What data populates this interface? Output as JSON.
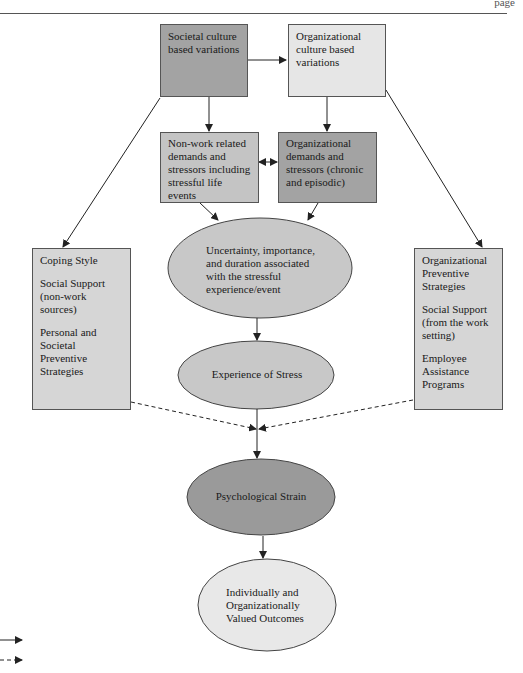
{
  "header": {
    "text": "page"
  },
  "nodes": {
    "societal_culture": {
      "label": "Societal culture based variations",
      "fill": "#a3a3a3"
    },
    "organizational_culture": {
      "label": "Organizational culture based variations",
      "fill": "#e6e6e6"
    },
    "nonwork_demands": {
      "label": "Non-work related demands and stressors including stressful life events",
      "fill": "#c4c4c4"
    },
    "org_demands": {
      "label": "Organizational demands and stressors (chronic and episodic)",
      "fill": "#a3a3a3"
    },
    "coping": {
      "fill": "#d6d6d6",
      "items": [
        "Coping Style",
        "Social Support (non-work sources)",
        "Personal and Societal Preventive Strategies"
      ]
    },
    "org_preventive": {
      "fill": "#d6d6d6",
      "items": [
        "Organizational Preventive Strategies",
        "Social Support (from the work setting)",
        "Employee Assistance Programs"
      ]
    },
    "uncertainty": {
      "label": "Uncertainty, importance, and duration associated with the stressful experience/event",
      "fill": "#c8c8c8"
    },
    "experience": {
      "label": "Experience of Stress",
      "fill": "#c8c8c8"
    },
    "strain": {
      "label": "Psychological Strain",
      "fill": "#9a9a9a"
    },
    "outcomes": {
      "label": "Individually and Organizationally Valued Outcomes",
      "fill": "#e8e8e8"
    }
  },
  "edges": [
    {
      "from": "Societal culture based variations",
      "to": "Organizational culture based variations",
      "style": "solid"
    },
    {
      "from": "Societal culture based variations",
      "to": "Non-work related demands and stressors",
      "style": "solid"
    },
    {
      "from": "Societal culture based variations",
      "to": "Coping Style",
      "style": "solid"
    },
    {
      "from": "Organizational culture based variations",
      "to": "Organizational demands and stressors",
      "style": "solid"
    },
    {
      "from": "Organizational culture based variations",
      "to": "Organizational Preventive Strategies",
      "style": "solid"
    },
    {
      "from": "Non-work related demands and stressors",
      "to": "Organizational demands and stressors",
      "style": "bidirectional"
    },
    {
      "from": "Non-work related demands and stressors",
      "to": "Uncertainty, importance, and duration",
      "style": "solid"
    },
    {
      "from": "Organizational demands and stressors",
      "to": "Uncertainty, importance, and duration",
      "style": "solid"
    },
    {
      "from": "Uncertainty, importance, and duration",
      "to": "Experience of Stress",
      "style": "solid"
    },
    {
      "from": "Experience of Stress",
      "to": "Psychological Strain",
      "style": "solid"
    },
    {
      "from": "Coping Style",
      "to": "Experience-Strain link",
      "style": "dashed"
    },
    {
      "from": "Organizational Preventive Strategies",
      "to": "Experience-Strain link",
      "style": "dashed"
    },
    {
      "from": "Psychological Strain",
      "to": "Individually and Organizationally Valued Outcomes",
      "style": "solid"
    }
  ],
  "legend": [
    {
      "style": "solid",
      "label": ""
    },
    {
      "style": "dashed",
      "label": ""
    }
  ]
}
